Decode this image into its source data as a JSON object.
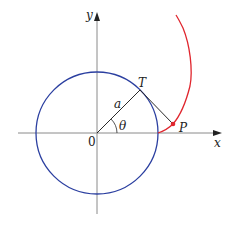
{
  "figure": {
    "labels": {
      "x_axis": "x",
      "y_axis": "y",
      "origin": "0",
      "point_T": "T",
      "point_P": "P",
      "radius": "a",
      "angle": "θ"
    },
    "colors": {
      "circle": "#2b3fa0",
      "involute": "#e0262e",
      "axes": "#8a8a8a",
      "segments": "#2a2a2a",
      "point_P": "#e0262e"
    }
  }
}
